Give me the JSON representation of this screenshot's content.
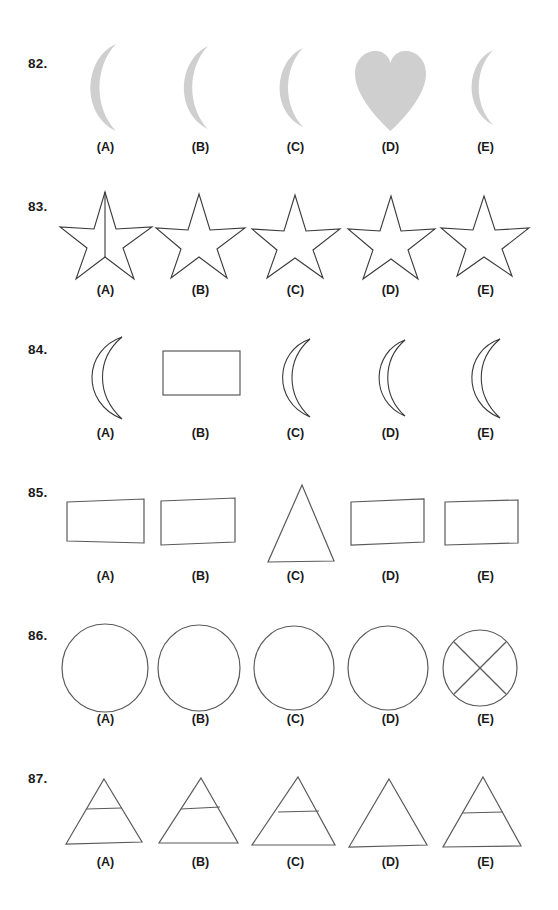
{
  "page": {
    "kind": "visual-discrimination-worksheet",
    "background_color": "#ffffff",
    "ink_color": "#3a3a3a",
    "fill_gray": "#cfcfcf",
    "text_color": "#1a1a1a"
  },
  "option_labels": [
    "(A)",
    "(B)",
    "(C)",
    "(D)",
    "(E)"
  ],
  "questions": [
    {
      "number": "82.",
      "options": [
        {
          "label": "(A)",
          "shape": "crescent-filled"
        },
        {
          "label": "(B)",
          "shape": "crescent-filled"
        },
        {
          "label": "(C)",
          "shape": "crescent-filled"
        },
        {
          "label": "(D)",
          "shape": "heart-filled"
        },
        {
          "label": "(E)",
          "shape": "crescent-filled"
        }
      ]
    },
    {
      "number": "83.",
      "options": [
        {
          "label": "(A)",
          "shape": "star-outline-with-vertical-line"
        },
        {
          "label": "(B)",
          "shape": "star-outline"
        },
        {
          "label": "(C)",
          "shape": "star-outline"
        },
        {
          "label": "(D)",
          "shape": "star-outline"
        },
        {
          "label": "(E)",
          "shape": "star-outline"
        }
      ]
    },
    {
      "number": "84.",
      "options": [
        {
          "label": "(A)",
          "shape": "crescent-outline"
        },
        {
          "label": "(B)",
          "shape": "rectangle-outline"
        },
        {
          "label": "(C)",
          "shape": "crescent-outline"
        },
        {
          "label": "(D)",
          "shape": "crescent-outline"
        },
        {
          "label": "(E)",
          "shape": "crescent-outline"
        }
      ]
    },
    {
      "number": "85.",
      "options": [
        {
          "label": "(A)",
          "shape": "rectangle-outline"
        },
        {
          "label": "(B)",
          "shape": "rectangle-outline"
        },
        {
          "label": "(C)",
          "shape": "triangle-outline"
        },
        {
          "label": "(D)",
          "shape": "rectangle-outline"
        },
        {
          "label": "(E)",
          "shape": "rectangle-outline"
        }
      ]
    },
    {
      "number": "86.",
      "options": [
        {
          "label": "(A)",
          "shape": "circle-outline"
        },
        {
          "label": "(B)",
          "shape": "circle-outline"
        },
        {
          "label": "(C)",
          "shape": "circle-outline"
        },
        {
          "label": "(D)",
          "shape": "circle-outline"
        },
        {
          "label": "(E)",
          "shape": "circle-outline-with-x"
        }
      ]
    },
    {
      "number": "87.",
      "options": [
        {
          "label": "(A)",
          "shape": "triangle-outline-with-crossbar"
        },
        {
          "label": "(B)",
          "shape": "triangle-outline-with-crossbar"
        },
        {
          "label": "(C)",
          "shape": "triangle-outline-with-crossbar"
        },
        {
          "label": "(D)",
          "shape": "triangle-outline"
        },
        {
          "label": "(E)",
          "shape": "triangle-outline-with-crossbar"
        }
      ]
    }
  ],
  "layout": {
    "row_tops": [
      30,
      173,
      316,
      459,
      602,
      745
    ],
    "column_lefts": [
      58,
      153,
      248,
      343,
      438
    ]
  }
}
